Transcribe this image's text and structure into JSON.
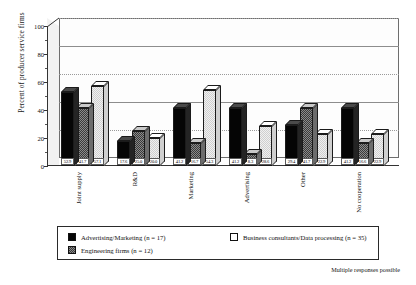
{
  "chart_data": {
    "type": "bar",
    "title": "",
    "xlabel": "",
    "ylabel": "Percent of producer service firms",
    "ylim": [
      0,
      100
    ],
    "yticks": [
      0,
      20,
      40,
      60,
      80,
      100
    ],
    "grid": true,
    "legend_position": "bottom",
    "note": "Multiple responses possible",
    "categories": [
      "Joint supply",
      "R&D",
      "Marketing",
      "Advertising",
      "Other",
      "No cooperation"
    ],
    "series": [
      {
        "name": "Advertising/Marketing (n = 17)",
        "color": "#050505",
        "values": [
          52.9,
          17.6,
          41.2,
          41.2,
          29.4,
          41.2
        ],
        "labels": [
          "52.9",
          "17.6",
          "41.2",
          "41.2",
          "29.4",
          "41.2"
        ]
      },
      {
        "name": "Engineering firms (n = 12)",
        "color": "#8a8a8a",
        "values": [
          41.7,
          25.0,
          16.7,
          8.3,
          41.7,
          16.6
        ],
        "labels": [
          "41.7",
          "25.0",
          "16.7",
          "8.3",
          "41.7",
          "16.6"
        ]
      },
      {
        "name": "Business consultants/Data processing (n = 35)",
        "color": "#f0f0f0",
        "values": [
          57.1,
          20.0,
          54.3,
          28.6,
          22.9,
          22.9
        ],
        "labels": [
          "57.1",
          "20.0",
          "54.3",
          "28.6",
          "22.9",
          "22.9"
        ]
      }
    ]
  },
  "axis": {
    "y_title": "Percent of producer service firms",
    "tick_0": "0",
    "tick_1": "20",
    "tick_2": "40",
    "tick_3": "60",
    "tick_4": "80",
    "tick_5": "100"
  },
  "legend": {
    "entry_0": "Advertising/Marketing (n = 17)",
    "entry_1": "Engineering firms (n = 12)",
    "entry_2": "Business consultants/Data processing (n = 35)"
  },
  "footer": {
    "note": "Multiple responses possible"
  }
}
